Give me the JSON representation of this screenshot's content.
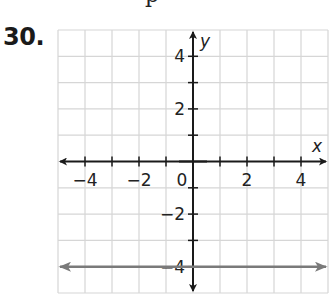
{
  "problem": {
    "number": "30.",
    "cropped_heading_glyph": "p"
  },
  "chart_data": {
    "type": "line",
    "title": "",
    "xlabel": "x",
    "ylabel": "y",
    "xlim": [
      -5,
      5
    ],
    "ylim": [
      -5,
      5
    ],
    "grid": true,
    "grid_step": 1,
    "x_ticks": [
      -4,
      -2,
      0,
      2,
      4
    ],
    "y_ticks": [
      -4,
      -2,
      2,
      4
    ],
    "tick_labels": {
      "x": [
        "−4",
        "−2",
        "0",
        "2",
        "4"
      ],
      "y": [
        "4",
        "2",
        "−2",
        "−4"
      ]
    },
    "series": [
      {
        "name": "horizontal line",
        "equation": "y = -4",
        "x": [
          -5,
          5
        ],
        "y": [
          -4,
          -4
        ],
        "color": "#7a7a7a",
        "arrows": "both"
      }
    ],
    "colors": {
      "grid": "#d6d6d6",
      "axes": "#1a1a1a",
      "line": "#7a7a7a"
    }
  }
}
